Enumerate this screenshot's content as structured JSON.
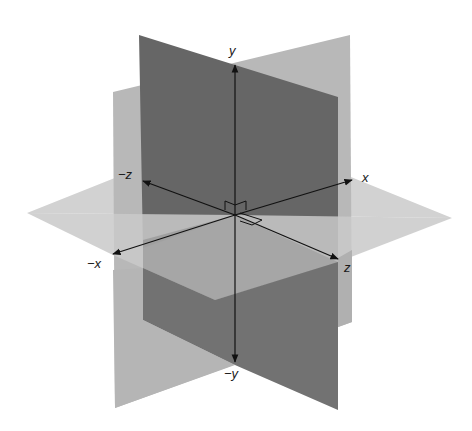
{
  "figure": {
    "axes": {
      "y": "y",
      "neg_y": "−y",
      "x": "x",
      "neg_x": "−x",
      "z": "z",
      "neg_z": "−z"
    },
    "colors": {
      "background": "#ffffff",
      "light_plane": "#b9b9b9",
      "dark_plane": "#6e6e6e",
      "horizontal_plane": "#cfcfcf",
      "axis": "#111111"
    }
  }
}
